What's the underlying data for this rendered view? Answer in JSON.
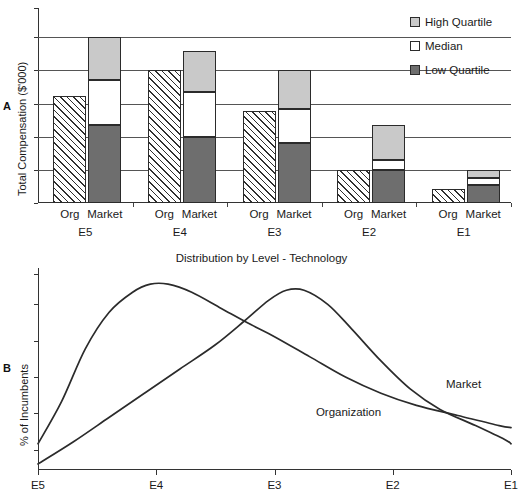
{
  "panels": {
    "a_letter": "A",
    "b_letter": "B"
  },
  "chart_data": [
    {
      "type": "bar",
      "panel": "A",
      "title": "",
      "xlabel": "",
      "ylabel": "Total Compensation ($'000)",
      "grid": true,
      "axis_values_shown": false,
      "ylim": [
        0,
        100
      ],
      "gridlines": [
        17,
        34,
        51,
        68,
        85
      ],
      "legend_position": "top-right",
      "legend": [
        {
          "label": "High Quartile",
          "color": "#c9c9c9",
          "swatch": "high"
        },
        {
          "label": "Median",
          "color": "#ffffff",
          "swatch": "med"
        },
        {
          "label": "Low Quartile",
          "color": "#6e6e6e",
          "swatch": "low"
        }
      ],
      "categories": [
        "E5",
        "E4",
        "E3",
        "E2",
        "E1"
      ],
      "series_labels": [
        "Org",
        "Market"
      ],
      "groups": [
        {
          "level": "E5",
          "org": {
            "label": "Org",
            "value": 55,
            "fill": "hatch"
          },
          "market": {
            "label": "Market",
            "low_quartile": 40,
            "median": 23,
            "high_quartile": 22,
            "total": 85
          }
        },
        {
          "level": "E4",
          "org": {
            "label": "Org",
            "value": 68,
            "fill": "hatch"
          },
          "market": {
            "label": "Market",
            "low_quartile": 34,
            "median": 23,
            "high_quartile": 21,
            "total": 78
          }
        },
        {
          "level": "E3",
          "org": {
            "label": "Org",
            "value": 47,
            "fill": "hatch"
          },
          "market": {
            "label": "Market",
            "low_quartile": 31,
            "median": 17,
            "high_quartile": 20,
            "total": 68
          }
        },
        {
          "level": "E2",
          "org": {
            "label": "Org",
            "value": 17,
            "fill": "hatch"
          },
          "market": {
            "label": "Market",
            "low_quartile": 17,
            "median": 5,
            "high_quartile": 18,
            "total": 40
          }
        },
        {
          "level": "E1",
          "org": {
            "label": "Org",
            "value": 7,
            "fill": "hatch"
          },
          "market": {
            "label": "Market",
            "low_quartile": 9,
            "median": 4,
            "high_quartile": 4,
            "total": 17
          }
        }
      ]
    },
    {
      "type": "line",
      "panel": "B",
      "title": "Distribution by Level - Technology",
      "xlabel": "",
      "ylabel": "% of Incumbents",
      "grid": false,
      "axis_values_shown": false,
      "categories": [
        "E5",
        "E4",
        "E3",
        "E2",
        "E1"
      ],
      "x": [
        0,
        1,
        2,
        3,
        4
      ],
      "legend_position": "inline-annotation",
      "series": [
        {
          "name": "Market",
          "label_x": 3.45,
          "label_y": 42,
          "values": [
            13,
            88,
            78,
            44,
            24
          ],
          "points": [
            [
              0.0,
              13
            ],
            [
              0.2,
              34
            ],
            [
              0.4,
              60
            ],
            [
              0.6,
              78
            ],
            [
              0.8,
              88
            ],
            [
              0.95,
              92
            ],
            [
              1.1,
              92
            ],
            [
              1.3,
              88
            ],
            [
              1.55,
              80
            ],
            [
              1.8,
              72
            ],
            [
              2.0,
              66
            ],
            [
              2.3,
              56
            ],
            [
              2.6,
              46
            ],
            [
              2.9,
              38
            ],
            [
              3.2,
              32
            ],
            [
              3.55,
              27
            ],
            [
              3.9,
              22
            ],
            [
              4.0,
              21
            ]
          ]
        },
        {
          "name": "Organization",
          "label_x": 2.35,
          "label_y": 28,
          "values": [
            3,
            44,
            88,
            30,
            12
          ],
          "points": [
            [
              0.0,
              3
            ],
            [
              0.3,
              14
            ],
            [
              0.6,
              26
            ],
            [
              0.9,
              38
            ],
            [
              1.2,
              50
            ],
            [
              1.5,
              62
            ],
            [
              1.75,
              74
            ],
            [
              1.95,
              84
            ],
            [
              2.1,
              89
            ],
            [
              2.25,
              89
            ],
            [
              2.45,
              82
            ],
            [
              2.65,
              70
            ],
            [
              2.9,
              54
            ],
            [
              3.15,
              40
            ],
            [
              3.4,
              30
            ],
            [
              3.7,
              22
            ],
            [
              3.95,
              15
            ],
            [
              4.0,
              13
            ]
          ]
        }
      ]
    }
  ]
}
